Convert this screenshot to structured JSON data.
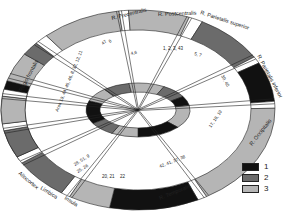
{
  "diagram": {
    "center": [
      138,
      110
    ],
    "outer_ring": {
      "rx_out": 137,
      "ry_out": 100,
      "rx_in": 113,
      "ry_in": 80
    },
    "inner_ring": {
      "rx_out": 52,
      "ry_out": 27,
      "rx_in": 38,
      "ry_in": 18
    },
    "colors": {
      "1": "#111111",
      "2": "#6b6b6b",
      "3": "#b5b5b5",
      "gap": "#ffffff"
    },
    "outer_segments": [
      {
        "start": 150,
        "end": 197,
        "cat": "1"
      },
      {
        "start": 197,
        "end": 214,
        "cat": "3"
      },
      {
        "start": 214,
        "end": 222,
        "cat": "2"
      },
      {
        "start": 222,
        "end": 228,
        "cat": "gap"
      },
      {
        "start": 228,
        "end": 262,
        "cat": "3"
      },
      {
        "start": 262,
        "end": 266,
        "cat": "gap"
      },
      {
        "start": 266,
        "end": 292,
        "cat": "3"
      },
      {
        "start": 292,
        "end": 298,
        "cat": "gap"
      },
      {
        "start": 298,
        "end": 328,
        "cat": "2"
      },
      {
        "start": 328,
        "end": 332,
        "cat": "gap"
      },
      {
        "start": 332,
        "end": 355,
        "cat": "1"
      },
      {
        "start": 355,
        "end": 359,
        "cat": "gap"
      },
      {
        "start": 359,
        "end": 420,
        "cat": "3"
      },
      {
        "start": 420,
        "end": 424,
        "cat": "gap"
      },
      {
        "start": 424,
        "end": 462,
        "cat": "1"
      },
      {
        "start": 462,
        "end": 480,
        "cat": "3"
      },
      {
        "start": 480,
        "end": 484,
        "cat": "gap"
      },
      {
        "start": 484,
        "end": 508,
        "cat": "2"
      },
      {
        "start": 508,
        "end": 512,
        "cat": "gap"
      },
      {
        "start": 512,
        "end": 528,
        "cat": "2"
      },
      {
        "start": 528,
        "end": 532,
        "cat": "gap"
      },
      {
        "start": 532,
        "end": 548,
        "cat": "3"
      },
      {
        "start": 548,
        "end": 552,
        "cat": "gap"
      },
      {
        "start": 552,
        "end": 510,
        "cat": "none"
      }
    ],
    "inner_segments": [
      {
        "start": 150,
        "end": 200,
        "cat": "1"
      },
      {
        "start": 200,
        "end": 230,
        "cat": "3"
      },
      {
        "start": 230,
        "end": 260,
        "cat": "2"
      },
      {
        "start": 260,
        "end": 300,
        "cat": "3"
      },
      {
        "start": 300,
        "end": 330,
        "cat": "2"
      },
      {
        "start": 330,
        "end": 350,
        "cat": "1"
      },
      {
        "start": 350,
        "end": 400,
        "cat": "3"
      },
      {
        "start": 400,
        "end": 450,
        "cat": "1"
      },
      {
        "start": 450,
        "end": 480,
        "cat": "3"
      },
      {
        "start": 480,
        "end": 510,
        "cat": "2"
      }
    ],
    "spokes": [
      222,
      262,
      292,
      328,
      355,
      420,
      480,
      508,
      528,
      548,
      200
    ],
    "region_labels": [
      {
        "text": "Regio frontalis",
        "x": 22,
        "y": 92,
        "rot": -62
      },
      {
        "text": "R. Precentralis",
        "x": 112,
        "y": 20,
        "rot": -14
      },
      {
        "text": "R. Postcentralis",
        "x": 158,
        "y": 16,
        "rot": -2
      },
      {
        "text": "R. Parietalis superior",
        "x": 200,
        "y": 14,
        "rot": 18
      },
      {
        "text": "R. Parietalis inferior",
        "x": 257,
        "y": 56,
        "rot": 62
      },
      {
        "text": "R. Occipitalis",
        "x": 252,
        "y": 146,
        "rot": -52
      },
      {
        "text": "R. Temporalis",
        "x": 160,
        "y": 200,
        "rot": -22
      },
      {
        "text": "Insula",
        "x": 64,
        "y": 199,
        "rot": 32
      },
      {
        "text": "Limbica",
        "x": 40,
        "y": 189,
        "rot": 32
      },
      {
        "text": "Allocortex",
        "x": 18,
        "y": 174,
        "rot": 40
      }
    ],
    "area_labels": [
      {
        "text": "Area 10, 44, 45, 46, 8, 32, 12, 11",
        "x": 58,
        "y": 112,
        "rot": -68
      },
      {
        "text": "47",
        "x": 103,
        "y": 45,
        "rot": -40
      },
      {
        "text": "6",
        "x": 110,
        "y": 43,
        "rot": -40
      },
      {
        "text": "4,6",
        "x": 131,
        "y": 55,
        "rot": -12
      },
      {
        "text": "1, 2, 3, 43",
        "x": 163,
        "y": 50,
        "rot": 0
      },
      {
        "text": "5, 7",
        "x": 194,
        "y": 55,
        "rot": 15
      },
      {
        "text": "39, 40",
        "x": 221,
        "y": 76,
        "rot": 62
      },
      {
        "text": "17, 18, 19",
        "x": 211,
        "y": 128,
        "rot": -56
      },
      {
        "text": "42, 41, 37, 38",
        "x": 160,
        "y": 168,
        "rot": -22
      },
      {
        "text": "20, 21",
        "x": 102,
        "y": 178,
        "rot": 0
      },
      {
        "text": "22",
        "x": 120,
        "y": 178,
        "rot": 0
      },
      {
        "text": "28, 51, 9",
        "x": 75,
        "y": 166,
        "rot": -32
      },
      {
        "text": "25, 26",
        "x": 78,
        "y": 173,
        "rot": -32
      }
    ]
  },
  "legend": {
    "items": [
      {
        "label": "1",
        "color": "#111111"
      },
      {
        "label": "2",
        "color": "#6b6b6b"
      },
      {
        "label": "3",
        "color": "#b5b5b5"
      }
    ]
  }
}
